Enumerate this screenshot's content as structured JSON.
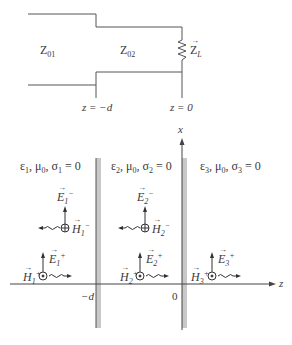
{
  "transmission_line": {
    "section1_label": "Z",
    "section1_sub": "01",
    "section2_label": "Z",
    "section2_sub": "02",
    "load_label": "Z",
    "load_sub": "L",
    "marker_left": "z = −d",
    "marker_right": "z = 0"
  },
  "regions": [
    {
      "eps": "ε",
      "eps_sub": "1",
      "mu": "μ",
      "mu_sub": "0",
      "sigma": "σ",
      "sigma_sub": "1",
      "value": " = 0"
    },
    {
      "eps": "ε",
      "eps_sub": "2",
      "mu": "μ",
      "mu_sub": "0",
      "sigma": "σ",
      "sigma_sub": "2",
      "value": " = 0"
    },
    {
      "eps": "ε",
      "eps_sub": "3",
      "mu": "μ",
      "mu_sub": "0",
      "sigma": "σ",
      "sigma_sub": "3",
      "value": " = 0"
    }
  ],
  "fields": {
    "E1_minus": {
      "sym": "E",
      "sub": "1",
      "sup": "−"
    },
    "H1_minus": {
      "sym": "H",
      "sub": "1",
      "sup": "−"
    },
    "E2_minus": {
      "sym": "E",
      "sub": "2",
      "sup": "−"
    },
    "H2_minus": {
      "sym": "H",
      "sub": "2",
      "sup": "−"
    },
    "E1_plus": {
      "sym": "E",
      "sub": "1",
      "sup": "+"
    },
    "H1_plus": {
      "sym": "H",
      "sub": "1",
      "sup": "+"
    },
    "E2_plus": {
      "sym": "E",
      "sub": "2",
      "sup": "+"
    },
    "H2_plus": {
      "sym": "H",
      "sub": "2",
      "sup": "+"
    },
    "E3_plus": {
      "sym": "E",
      "sub": "3",
      "sup": "+"
    },
    "H3_plus": {
      "sym": "H",
      "sub": "3",
      "sup": "+"
    }
  },
  "axes": {
    "x_label": "x",
    "z_label": "z",
    "tick_minus_d": "−d",
    "tick_zero": "0"
  }
}
